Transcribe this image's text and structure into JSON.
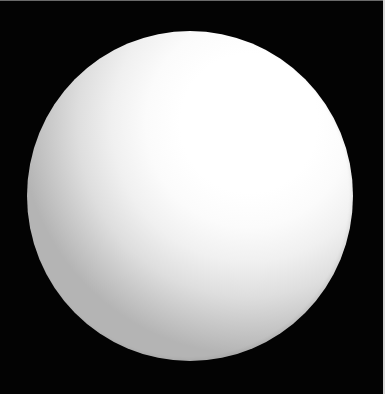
{
  "scene": {
    "description": "White sphere on black background",
    "background_color": "#030303",
    "subject": {
      "type": "sphere",
      "color_highlight": "#ffffff",
      "color_shadow": "#b4b4b4",
      "light_direction": "upper-right",
      "bounds": {
        "left": 27,
        "top": 31,
        "right": 352,
        "bottom": 360
      }
    },
    "frame_edges": {
      "top_color": "#6a6a6a",
      "right_color": "#d8d8d8"
    },
    "caption": ""
  }
}
